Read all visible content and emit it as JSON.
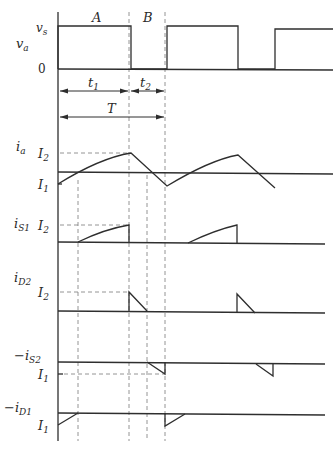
{
  "diagram": {
    "type": "chopper-current-waveforms",
    "intervals": {
      "A": "A",
      "B": "B",
      "t1": "t",
      "t1_sub": "1",
      "t2": "t",
      "t2_sub": "2",
      "T": "T"
    },
    "traces": {
      "va": {
        "label": "v",
        "sub": "a",
        "levels": {
          "high": "v",
          "high_sub": "s",
          "zero": "0"
        }
      },
      "ia": {
        "label": "i",
        "sub": "a",
        "levels": {
          "I2": "I",
          "I2_sub": "2",
          "I1": "I",
          "I1_sub": "1"
        }
      },
      "iS1": {
        "label": "i",
        "sub": "S1",
        "levels": {
          "I2": "I",
          "I2_sub": "2"
        }
      },
      "iD2": {
        "label": "i",
        "sub": "D2",
        "levels": {
          "I2": "I",
          "I2_sub": "2"
        }
      },
      "iS2": {
        "prefix": "−",
        "label": "i",
        "sub": "S2",
        "levels": {
          "I1": "I",
          "I1_sub": "1"
        }
      },
      "iD1": {
        "prefix": "−",
        "label": "i",
        "sub": "D1",
        "levels": {
          "I1": "I",
          "I1_sub": "1"
        }
      }
    },
    "colors": {
      "line": "#2e2e2e",
      "dash": "#7a7a7a",
      "background": "#ffffff"
    }
  }
}
